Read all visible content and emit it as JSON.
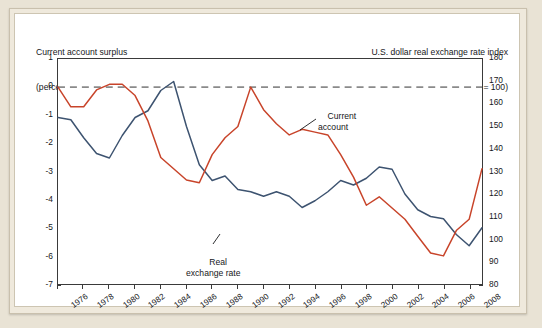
{
  "header": {
    "left_title": "Current account surplus",
    "left_subtitle": "(percent of GDP)",
    "right_title": "U.S. dollar real exchange rate index",
    "right_subtitle": "(2005 = 100)"
  },
  "annotations": {
    "current_account": "Current\naccount",
    "real_exchange_rate": "Real\nexchange rate"
  },
  "colors": {
    "current_account": "#c8442a",
    "real_exchange_rate": "#3d5370",
    "zero_line": "#8a8a8a",
    "axis": "#3a3a3a",
    "card": "#ffffff",
    "frame": "#efe9dc",
    "page_background": "#e9e3d5"
  },
  "chart_data": {
    "type": "line",
    "title": "",
    "xlabel": "",
    "grid": false,
    "legend": "annotations-on-plot",
    "zero_reference_line": 0,
    "x": [
      1976,
      1977,
      1978,
      1979,
      1980,
      1981,
      1982,
      1983,
      1984,
      1985,
      1986,
      1987,
      1988,
      1989,
      1990,
      1991,
      1992,
      1993,
      1994,
      1995,
      1996,
      1997,
      1998,
      1999,
      2000,
      2001,
      2002,
      2003,
      2004,
      2005,
      2006,
      2007,
      2008,
      2009
    ],
    "xtick_labels": [
      "1976",
      "1978",
      "1980",
      "1982",
      "1984",
      "1986",
      "1988",
      "1990",
      "1992",
      "1994",
      "1996",
      "1998",
      "2000",
      "2002",
      "2004",
      "2006",
      "2008"
    ],
    "xlim": [
      1976,
      2009
    ],
    "axes": [
      {
        "id": "left",
        "label": "Current account surplus (percent of GDP)",
        "ylim": [
          -7,
          1
        ],
        "ticks": [
          1,
          0,
          -1,
          -2,
          -3,
          -4,
          -5,
          -6,
          -7
        ],
        "tick_labels": [
          "1",
          "0",
          "-1",
          "-2",
          "-3",
          "-4",
          "-5",
          "-6",
          "-7"
        ]
      },
      {
        "id": "right",
        "label": "U.S. dollar real exchange rate index (2005 = 100)",
        "ylim": [
          80,
          180
        ],
        "ticks": [
          180,
          170,
          160,
          150,
          140,
          130,
          120,
          110,
          100,
          90,
          80
        ],
        "tick_labels": [
          "180",
          "170",
          "160",
          "150",
          "140",
          "130",
          "120",
          "110",
          "100",
          "90",
          "80"
        ]
      }
    ],
    "series": [
      {
        "name": "Current account",
        "axis": "left",
        "units": "percent of GDP",
        "color": "#c8442a",
        "values": [
          0.0,
          -0.7,
          -0.7,
          -0.1,
          0.1,
          0.1,
          -0.3,
          -1.2,
          -2.5,
          -2.9,
          -3.3,
          -3.4,
          -2.4,
          -1.8,
          -1.4,
          0.0,
          -0.8,
          -1.3,
          -1.7,
          -1.5,
          -1.6,
          -1.7,
          -2.4,
          -3.2,
          -4.2,
          -3.9,
          -4.3,
          -4.7,
          -5.3,
          -5.9,
          -6.0,
          -5.1,
          -4.7,
          -2.9
        ]
      },
      {
        "name": "Real exchange rate",
        "axis": "right",
        "units": "index, 2005 = 100",
        "color": "#3d5370",
        "values": [
          154,
          153,
          145,
          138,
          136,
          146,
          154,
          157,
          166,
          170,
          150,
          133,
          126,
          128,
          122,
          121,
          119,
          121,
          119,
          114,
          117,
          121,
          126,
          124,
          127,
          132,
          131,
          120,
          113,
          110,
          109,
          102,
          97,
          105
        ]
      }
    ]
  }
}
